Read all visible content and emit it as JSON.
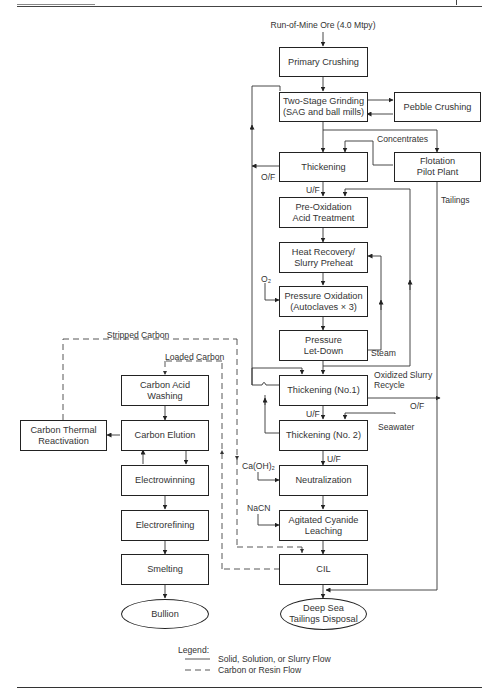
{
  "header": {
    "left_text": ""
  },
  "diagram": {
    "input": "Run-of-Mine Ore (4.0 Mtpy)",
    "boxes": {
      "primary_crushing": "Primary Crushing",
      "grinding_1": "Two-Stage Grinding",
      "grinding_2": "(SAG and ball mills)",
      "pebble_crushing": "Pebble Crushing",
      "thickening": "Thickening",
      "flotation_1": "Flotation",
      "flotation_2": "Pilot Plant",
      "preox_1": "Pre-Oxidation",
      "preox_2": "Acid Treatment",
      "heat_1": "Heat Recovery/",
      "heat_2": "Slurry Preheat",
      "pox_1": "Pressure Oxidation",
      "pox_2": "(Autoclaves × 3)",
      "letdown_1": "Pressure",
      "letdown_2": "Let-Down",
      "thick1": "Thickening (No.1)",
      "thick2": "Thickening (No. 2)",
      "neutralization": "Neutralization",
      "leach_1": "Agitated Cyanide",
      "leach_2": "Leaching",
      "cil": "CIL",
      "disposal_1": "Deep Sea",
      "disposal_2": "Tailings Disposal",
      "acid_wash_1": "Carbon Acid",
      "acid_wash_2": "Washing",
      "elution": "Carbon Elution",
      "reactivation_1": "Carbon Thermal",
      "reactivation_2": "Reactivation",
      "electrowinning": "Electrowinning",
      "electrorefining": "Electrorefining",
      "smelting": "Smelting",
      "bullion": "Bullion"
    },
    "labels": {
      "concentrates": "Concentrates",
      "of_thickening": "O/F",
      "uf_thickening": "U/F",
      "tailings": "Tailings",
      "o2": "O₂",
      "steam": "Steam",
      "oxidized_1": "Oxidized Slurry",
      "oxidized_2": "Recycle",
      "of_thick1": "O/F",
      "uf_thick1": "U/F",
      "seawater": "Seawater",
      "uf_thick2": "U/F",
      "caoh2": "Ca(OH)₂",
      "nacn": "NaCN",
      "stripped_carbon": "Stripped Carbon",
      "loaded_carbon": "Loaded Carbon"
    }
  },
  "legend": {
    "title": "Legend:",
    "items": [
      {
        "style": "solid",
        "label": "Solid, Solution, or Slurry Flow"
      },
      {
        "style": "dashed",
        "label": "Carbon or Resin Flow"
      }
    ]
  }
}
